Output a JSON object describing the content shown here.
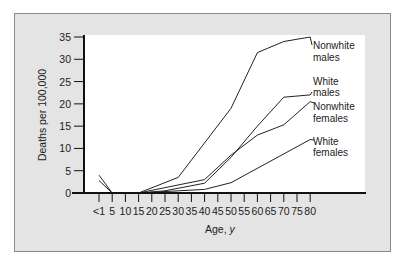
{
  "chart_data": {
    "type": "line",
    "title": "",
    "xlabel": "Age, y",
    "ylabel": "Deaths per 100,000",
    "ylim": [
      0,
      35
    ],
    "grid": false,
    "legend_position": "right-inline",
    "x_ticks": [
      "<1",
      "5",
      "10",
      "15",
      "20",
      "25",
      "30",
      "35",
      "40",
      "45",
      "50",
      "55",
      "60",
      "65",
      "70",
      "75",
      "80"
    ],
    "y_ticks": [
      "0",
      "5",
      "10",
      "15",
      "20",
      "25",
      "30",
      "35"
    ],
    "series": [
      {
        "name": "Nonwhite males",
        "points": [
          [
            0.5,
            4
          ],
          [
            5,
            0
          ],
          [
            15,
            0
          ],
          [
            30,
            3.5
          ],
          [
            50,
            19
          ],
          [
            60,
            31.5
          ],
          [
            70,
            34
          ],
          [
            80,
            35
          ]
        ]
      },
      {
        "name": "White males",
        "points": [
          [
            15,
            0
          ],
          [
            25,
            0.5
          ],
          [
            40,
            2.2
          ],
          [
            50,
            8
          ],
          [
            60,
            15
          ],
          [
            70,
            21.5
          ],
          [
            80,
            22
          ]
        ]
      },
      {
        "name": "Nonwhite females",
        "points": [
          [
            0.5,
            2.8
          ],
          [
            5,
            0
          ],
          [
            15,
            0
          ],
          [
            40,
            3
          ],
          [
            50,
            8.5
          ],
          [
            60,
            13
          ],
          [
            70,
            15.3
          ],
          [
            80,
            20.5
          ]
        ]
      },
      {
        "name": "White females",
        "points": [
          [
            15,
            0
          ],
          [
            40,
            0.8
          ],
          [
            50,
            2.3
          ],
          [
            80,
            12
          ]
        ]
      }
    ]
  },
  "legend": {
    "nonwhite_males": [
      "Nonwhite",
      "males"
    ],
    "white_males": [
      "White",
      "males"
    ],
    "nonwhite_females": [
      "Nonwhite",
      "females"
    ],
    "white_females": [
      "White",
      "females"
    ]
  }
}
